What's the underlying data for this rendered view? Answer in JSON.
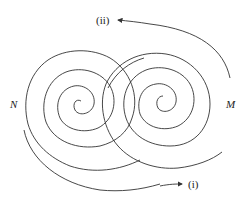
{
  "diagram": {
    "labels": {
      "left": "N",
      "right": "M",
      "top": "(ii)",
      "bottom": "(i)"
    },
    "colors": {
      "stroke": "#333333",
      "background": "#ffffff"
    }
  }
}
